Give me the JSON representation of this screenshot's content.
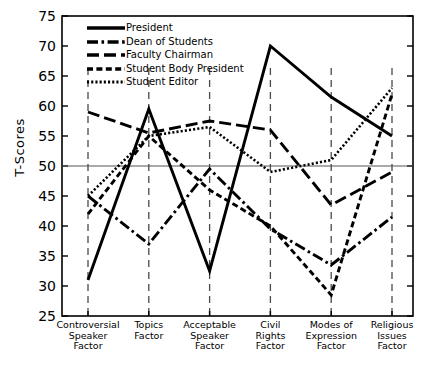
{
  "chart_data": {
    "type": "line",
    "title": "",
    "xlabel": "",
    "ylabel": "T-Scores",
    "ylim": [
      25,
      75
    ],
    "yticks": [
      25,
      30,
      35,
      40,
      45,
      50,
      55,
      60,
      65,
      70,
      75
    ],
    "grid": "vertical dashed gridlines at each category; horizontal reference line at T-Score 50",
    "legend_position": "upper-left inside axes",
    "reference_line": 50,
    "categories": [
      "Controversial Speaker Factor",
      "Topics Factor",
      "Acceptable Speaker Factor",
      "Civil Rights Factor",
      "Modes of Expression Factor",
      "Religious Issues Factor"
    ],
    "category_lines": [
      [
        "Controversial",
        "Speaker",
        "Factor"
      ],
      [
        "Topics",
        "Factor"
      ],
      [
        "Acceptable",
        "Speaker",
        "Factor"
      ],
      [
        "Civil",
        "Rights",
        "Factor"
      ],
      [
        "Modes of",
        "Expression",
        "Factor"
      ],
      [
        "Religious",
        "Issues",
        "Factor"
      ]
    ],
    "series": [
      {
        "name": "President",
        "style": "solid",
        "values": [
          31,
          59.5,
          32.5,
          70,
          61.5,
          55
        ]
      },
      {
        "name": "Dean of Students",
        "style": "dash-dot",
        "values": [
          45,
          37,
          49.5,
          39.5,
          33.5,
          41.5
        ]
      },
      {
        "name": "Faculty Chairman",
        "style": "long-dash",
        "values": [
          59,
          55.5,
          57.5,
          56,
          43.5,
          49
        ]
      },
      {
        "name": "Student Body President",
        "style": "dashed",
        "values": [
          42,
          55,
          46,
          40,
          28.5,
          62
        ]
      },
      {
        "name": "Student Editor",
        "style": "dotted",
        "values": [
          45,
          55,
          56.5,
          49,
          51,
          63
        ]
      }
    ],
    "colors": {
      "line": "#000000",
      "axis": "#000000",
      "grid": "#4a4a4a",
      "background": "#ffffff"
    }
  }
}
